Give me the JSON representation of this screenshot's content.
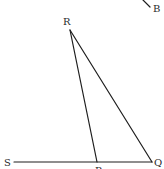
{
  "diagram": {
    "type": "geometry",
    "points": {
      "R": {
        "label": "R",
        "x": 70,
        "y": 30
      },
      "P": {
        "label": "P",
        "x": 97,
        "y": 162
      },
      "Q": {
        "label": "Q",
        "x": 152,
        "y": 162
      },
      "S": {
        "label": "S",
        "x": 14,
        "y": 162
      },
      "B": {
        "label": "B",
        "x": 150,
        "y": 7
      }
    },
    "labels": {
      "R": "R",
      "P": "P",
      "Q": "Q",
      "S": "S",
      "B": "B"
    },
    "segments": [
      {
        "from": "S",
        "to": "Q"
      },
      {
        "from": "R",
        "to": "P"
      },
      {
        "from": "R",
        "to": "Q"
      },
      {
        "from": "B_start",
        "to": "B"
      }
    ],
    "colors": {
      "line": "#1e1e1e",
      "label": "#2a2a2a",
      "background": "#ffffff"
    }
  }
}
